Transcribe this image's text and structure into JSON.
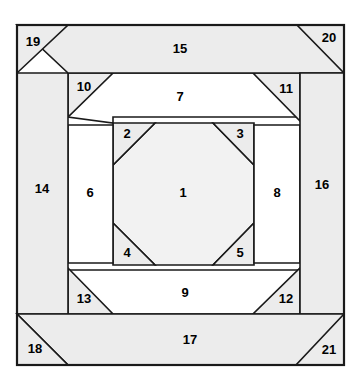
{
  "diagram": {
    "canvas": {
      "width": 360,
      "height": 387
    },
    "colors": {
      "shaded_fill": "#ececec",
      "light_fill": "#ffffff",
      "center_fill": "#f2f2f2",
      "line": "#1a1a1a",
      "label": "#000000",
      "background": "#ffffff"
    },
    "frame": {
      "x": 17,
      "y": 25,
      "width": 327,
      "height": 340
    },
    "pieces": [
      {
        "id": "piece-1",
        "label": "1",
        "shade": "center",
        "label_x": 183,
        "label_y": 194,
        "points": "155,123 213,123 254,165 254,223 213,265 155,265 113,223 113,165"
      },
      {
        "id": "piece-2",
        "label": "2",
        "shade": "shade",
        "label_x": 127,
        "label_y": 135,
        "points": "113,123 155,123 113,165"
      },
      {
        "id": "piece-3",
        "label": "3",
        "shade": "shade",
        "label_x": 240,
        "label_y": 135,
        "points": "213,123 254,123 254,165"
      },
      {
        "id": "piece-4",
        "label": "4",
        "shade": "shade",
        "label_x": 127,
        "label_y": 254,
        "points": "113,223 155,265 113,265"
      },
      {
        "id": "piece-5",
        "label": "5",
        "shade": "shade",
        "label_x": 240,
        "label_y": 254,
        "points": "254,223 254,265 213,265"
      },
      {
        "id": "piece-6",
        "label": "6",
        "shade": "light",
        "label_x": 90,
        "label_y": 194,
        "points": "68,125 113,125 113,263 68,263"
      },
      {
        "id": "piece-7",
        "label": "7",
        "shade": "light",
        "label_x": 180,
        "label_y": 98,
        "points": "68,73 300,73 300,117 113,117 113,123 68,117"
      },
      {
        "id": "piece-8",
        "label": "8",
        "shade": "light",
        "label_x": 277,
        "label_y": 194,
        "points": "254,125 300,125 300,263 254,263"
      },
      {
        "id": "piece-9",
        "label": "9",
        "shade": "light",
        "label_x": 185,
        "label_y": 294,
        "points": "68,270 300,270 300,314 68,314"
      },
      {
        "id": "piece-10",
        "label": "10",
        "shade": "shade",
        "label_x": 84,
        "label_y": 88,
        "points": "68,73 113,73 68,117"
      },
      {
        "id": "piece-11",
        "label": "11",
        "shade": "shade",
        "label_x": 286,
        "label_y": 90,
        "points": "253,73 300,73 300,121"
      },
      {
        "id": "piece-12",
        "label": "12",
        "shade": "shade",
        "label_x": 286,
        "label_y": 300,
        "points": "300,268 300,314 253,314"
      },
      {
        "id": "piece-13",
        "label": "13",
        "shade": "shade",
        "label_x": 84,
        "label_y": 300,
        "points": "68,268 113,314 68,314"
      },
      {
        "id": "piece-14",
        "label": "14",
        "shade": "shade",
        "label_x": 42,
        "label_y": 190,
        "points": "17,73 68,73 68,314 17,314"
      },
      {
        "id": "piece-15",
        "label": "15",
        "shade": "shade",
        "label_x": 180,
        "label_y": 50,
        "points": "17,25 344,25 344,73 68,73"
      },
      {
        "id": "piece-16",
        "label": "16",
        "shade": "shade",
        "label_x": 322,
        "label_y": 186,
        "points": "300,73 344,73 344,314 300,314"
      },
      {
        "id": "piece-17",
        "label": "17",
        "shade": "shade",
        "label_x": 190,
        "label_y": 341,
        "points": "17,314 344,314 344,365 68,365"
      },
      {
        "id": "piece-18",
        "label": "18",
        "shade": "shade",
        "label_x": 35,
        "label_y": 350,
        "points": "17,314 68,365 17,365"
      },
      {
        "id": "piece-19",
        "label": "19",
        "shade": "shade",
        "label_x": 33,
        "label_y": 43,
        "points": "17,25 68,25 17,73"
      },
      {
        "id": "piece-20",
        "label": "20",
        "shade": "shade",
        "label_x": 329,
        "label_y": 39,
        "points": "297,25 344,25 344,73"
      },
      {
        "id": "piece-21",
        "label": "21",
        "shade": "shade",
        "label_x": 329,
        "label_y": 351,
        "points": "344,314 344,365 296,365"
      }
    ]
  }
}
